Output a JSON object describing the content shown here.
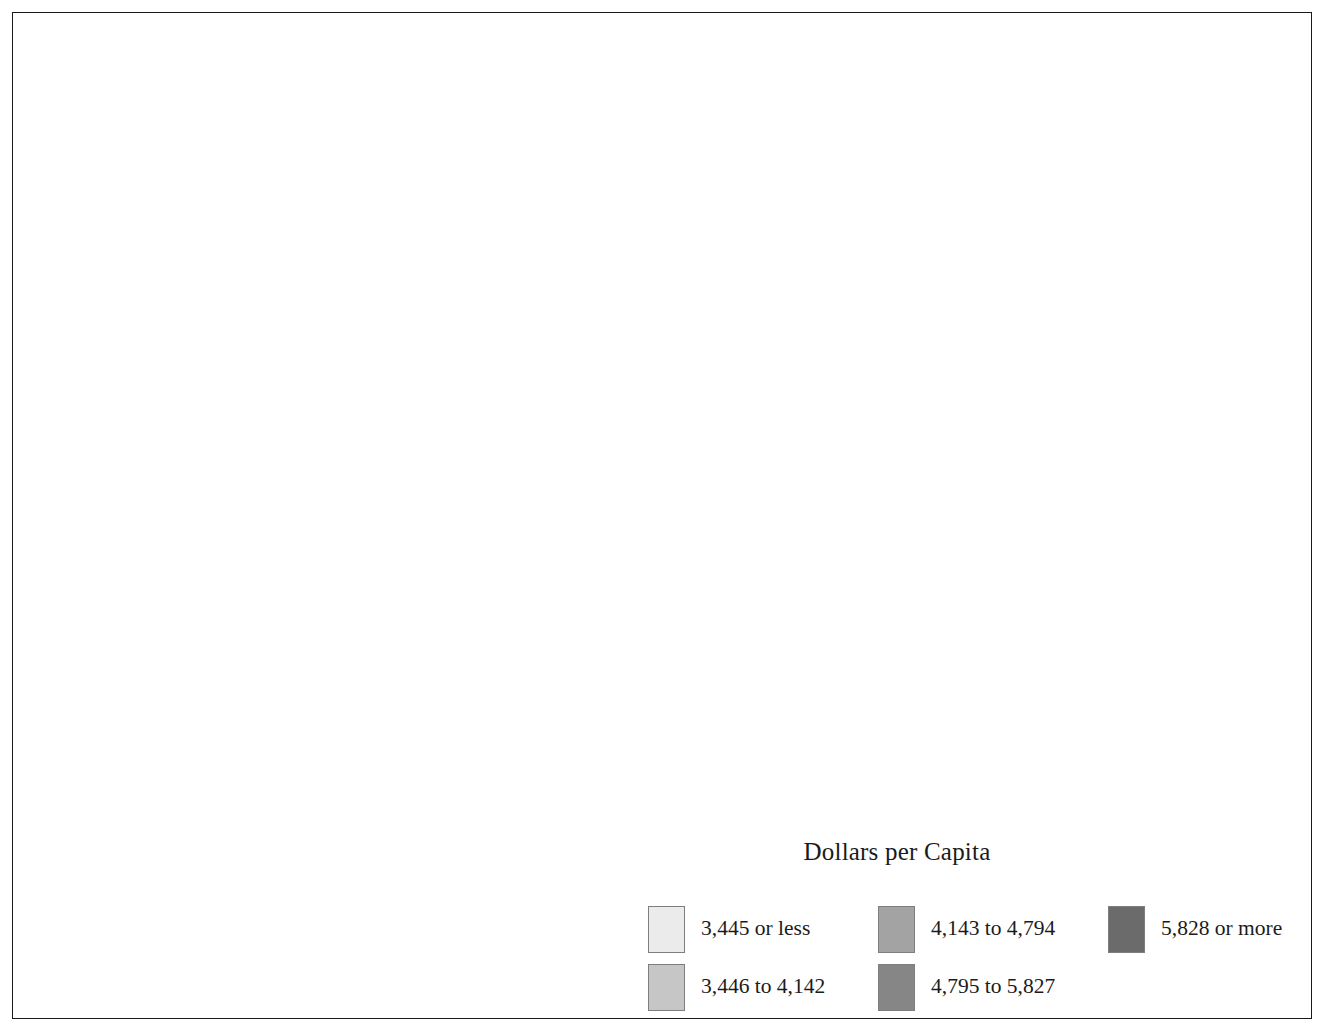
{
  "figure": {
    "title": "Dollars per Capita",
    "border_color": "#1a1a1a",
    "background": "#ffffff"
  },
  "legend": {
    "title": "Dollars per Capita",
    "classes": [
      {
        "label": "3,445 or less",
        "color": "#ebebeb",
        "order": 1
      },
      {
        "label": "3,446 to 4,142",
        "color": "#c6c6c6",
        "order": 2
      },
      {
        "label": "4,143 to 4,794",
        "color": "#a3a3a3",
        "order": 3
      },
      {
        "label": "4,795 to 5,827",
        "color": "#868686",
        "order": 4
      },
      {
        "label": "5,828 or more",
        "color": "#6b6b6b",
        "order": 5
      }
    ],
    "column_order": [
      [
        "3,445 or less",
        "4,143 to 4,794",
        "5,828 or more"
      ],
      [
        "3,446 to 4,142",
        "4,795 to 5,827",
        ""
      ]
    ]
  },
  "map": {
    "projection": "albers-usa",
    "unit": "county",
    "insets": [
      {
        "name": "hawaii",
        "label": ""
      },
      {
        "name": "alaska",
        "label": ""
      }
    ],
    "stroke_color": "#2b2b2b",
    "water_color": "#ffffff"
  },
  "chart_data": {
    "type": "map",
    "title": "Dollars per Capita",
    "subtitle": "",
    "xlabel": "",
    "ylabel": "",
    "unit": "Dollars per Capita",
    "geography": "United States counties (including Alaska and Hawaii insets)",
    "classification": "quintile",
    "class_count": 5,
    "legend_position": "bottom-right",
    "grid": false,
    "categories": [
      "3,445 or less",
      "3,446 to 4,142",
      "4,143 to 4,794",
      "4,795 to 5,827",
      "5,828 or more"
    ],
    "class_bounds": [
      {
        "label": "3,445 or less",
        "min": null,
        "max": 3445,
        "color": "#ebebeb"
      },
      {
        "label": "3,446 to 4,142",
        "min": 3446,
        "max": 4142,
        "color": "#c6c6c6"
      },
      {
        "label": "4,143 to 4,794",
        "min": 4143,
        "max": 4794,
        "color": "#a3a3a3"
      },
      {
        "label": "4,795 to 5,827",
        "min": 4795,
        "max": 5827,
        "color": "#868686"
      },
      {
        "label": "5,828 or more",
        "min": 5828,
        "max": null,
        "color": "#6b6b6b"
      }
    ],
    "values": [
      3445,
      4142,
      4794,
      5827,
      5828
    ],
    "colors": [
      "#ebebeb",
      "#c6c6c6",
      "#a3a3a3",
      "#868686",
      "#6b6b6b"
    ]
  }
}
